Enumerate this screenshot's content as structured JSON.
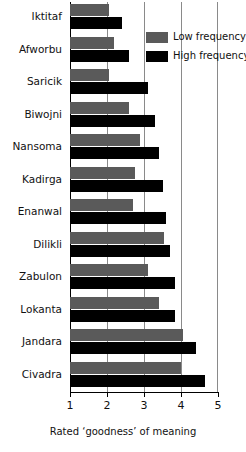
{
  "chart_data": {
    "type": "bar",
    "orientation": "horizontal",
    "title": "",
    "xlabel": "Rated ‘goodness’ of meaning",
    "ylabel": "",
    "xlim": [
      1,
      5
    ],
    "xticks": [
      1,
      2,
      3,
      4,
      5
    ],
    "xtick_labels": [
      "1",
      "2",
      "3",
      "4",
      "5"
    ],
    "grid": "vertical gridlines at each x tick",
    "legend_position": "upper right inside plot",
    "categories": [
      "Iktitaf",
      "Afworbu",
      "Saricik",
      "Biwojni",
      "Nansoma",
      "Kadirga",
      "Enanwal",
      "Dilikli",
      "Zabulon",
      "Lokanta",
      "Jandara",
      "Civadra"
    ],
    "series": [
      {
        "name": "Low frequency",
        "color": "#5a5a5a",
        "values": [
          2.05,
          2.2,
          2.05,
          2.6,
          2.9,
          2.75,
          2.7,
          3.55,
          3.1,
          3.4,
          4.05,
          4.0
        ]
      },
      {
        "name": "High frequency",
        "color": "#000000",
        "values": [
          2.4,
          2.6,
          3.1,
          3.3,
          3.4,
          3.5,
          3.6,
          3.7,
          3.85,
          3.85,
          4.4,
          4.65
        ]
      }
    ]
  },
  "legend": {
    "items": [
      {
        "label": "Low frequency",
        "swatch": "low"
      },
      {
        "label": "High frequency",
        "swatch": "high"
      }
    ]
  },
  "axis": {
    "x_title": "Rated ‘goodness’ of meaning"
  }
}
